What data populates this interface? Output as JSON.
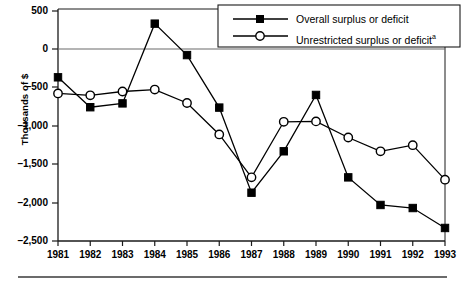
{
  "chart_data": {
    "type": "line",
    "title": "",
    "subtitle": "",
    "xlabel": "",
    "ylabel": "Thousands of $",
    "categories": [
      "1981",
      "1982",
      "1983",
      "1984",
      "1985",
      "1986",
      "1987",
      "1988",
      "1989",
      "1990",
      "1991",
      "1992",
      "1993"
    ],
    "x": [
      1981,
      1982,
      1983,
      1984,
      1985,
      1986,
      1987,
      1988,
      1989,
      1990,
      1991,
      1992,
      1993
    ],
    "xlim": [
      1981,
      1993
    ],
    "ylim": [
      -2500,
      500
    ],
    "yticks": [
      500,
      0,
      -500,
      -1000,
      -1500,
      -2000,
      -2500
    ],
    "ytick_labels": [
      "500",
      "0",
      "–500",
      "–1,000",
      "–1,500",
      "–2,000",
      "–2,500"
    ],
    "grid": false,
    "zero_line": true,
    "legend_position": "top-right",
    "series": [
      {
        "name": "Overall surplus or deficit",
        "marker": "filled-square",
        "color": "#000000",
        "values": [
          -365,
          -755,
          -705,
          335,
          -75,
          -760,
          -1870,
          -1330,
          -595,
          -1670,
          -2030,
          -2070,
          -2330
        ]
      },
      {
        "name": "Unrestricted surplus or deficit",
        "name_superscript": "a",
        "marker": "open-circle",
        "color": "#000000",
        "values": [
          -575,
          -600,
          -550,
          -525,
          -700,
          -1110,
          -1670,
          -945,
          -940,
          -1150,
          -1330,
          -1250,
          -1700
        ]
      }
    ]
  },
  "legend": {
    "items": [
      {
        "label": "Overall surplus or deficit",
        "superscript": ""
      },
      {
        "label": "Unrestricted surplus or deficit",
        "superscript": "a"
      }
    ]
  },
  "axis": {
    "y_title": "Thousands of $",
    "y_labels": [
      "500",
      "0",
      "–500",
      "–1,000",
      "–1,500",
      "–2,000",
      "–2,500"
    ],
    "x_labels": [
      "1981",
      "1982",
      "1983",
      "1984",
      "1985",
      "1986",
      "1987",
      "1988",
      "1989",
      "1990",
      "1991",
      "1992",
      "1993"
    ]
  },
  "colors": {
    "axis": "#1a1a1a",
    "series": "#000000",
    "zero_line": "#6a6a6a",
    "rule": "#3a3a3a"
  }
}
